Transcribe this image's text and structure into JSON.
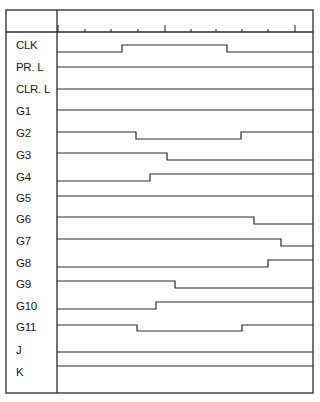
{
  "diagram": {
    "type": "timing-diagram",
    "frame": {
      "left": 6,
      "top": 10,
      "right": 313,
      "bottom": 393,
      "divider_x": 57,
      "header_y": 32
    },
    "ticks": {
      "baseline_y": 32,
      "positions": [
        58,
        85,
        111,
        138,
        165,
        191,
        216,
        242,
        268,
        295
      ],
      "major": [
        58,
        165,
        295
      ]
    },
    "signals": [
      {
        "name": "CLK",
        "label_y": 38,
        "segments": [
          [
            57,
            52
          ],
          [
            122,
            45
          ],
          [
            227,
            52
          ]
        ],
        "levels_y": {
          "low": 52,
          "high": 45
        }
      },
      {
        "name": "PR. L",
        "label_y": 60,
        "segments": [
          [
            57,
            67
          ]
        ]
      },
      {
        "name": "CLR. L",
        "label_y": 82,
        "segments": [
          [
            57,
            89
          ]
        ]
      },
      {
        "name": "G1",
        "label_y": 104,
        "segments": [
          [
            57,
            110
          ]
        ]
      },
      {
        "name": "G2",
        "label_y": 126,
        "segments": [
          [
            57,
            132
          ],
          [
            136,
            139
          ],
          [
            241,
            132
          ]
        ]
      },
      {
        "name": "G3",
        "label_y": 148,
        "segments": [
          [
            57,
            153
          ],
          [
            167,
            160
          ]
        ]
      },
      {
        "name": "G4",
        "label_y": 170,
        "segments": [
          [
            57,
            181
          ],
          [
            150,
            174
          ]
        ]
      },
      {
        "name": "G5",
        "label_y": 191,
        "segments": [
          [
            57,
            196
          ]
        ]
      },
      {
        "name": "G6",
        "label_y": 212,
        "segments": [
          [
            57,
            217
          ],
          [
            254,
            224
          ]
        ]
      },
      {
        "name": "G7",
        "label_y": 234,
        "segments": [
          [
            57,
            239
          ],
          [
            281,
            246
          ]
        ]
      },
      {
        "name": "G8",
        "label_y": 256,
        "segments": [
          [
            57,
            267
          ],
          [
            268,
            260
          ]
        ]
      },
      {
        "name": "G9",
        "label_y": 277,
        "segments": [
          [
            57,
            281
          ],
          [
            175,
            288
          ]
        ]
      },
      {
        "name": "G10",
        "label_y": 299,
        "segments": [
          [
            57,
            309
          ],
          [
            156,
            302
          ]
        ]
      },
      {
        "name": "G11",
        "label_y": 320,
        "segments": [
          [
            57,
            325
          ],
          [
            137,
            331
          ],
          [
            242,
            325
          ]
        ]
      },
      {
        "name": "J",
        "label_y": 343,
        "segments": [
          [
            57,
            352
          ]
        ]
      },
      {
        "name": "K",
        "label_y": 365,
        "segments": [
          [
            57,
            366
          ]
        ]
      }
    ],
    "line_color": "#2a2a2a",
    "background": "#ffffff"
  }
}
